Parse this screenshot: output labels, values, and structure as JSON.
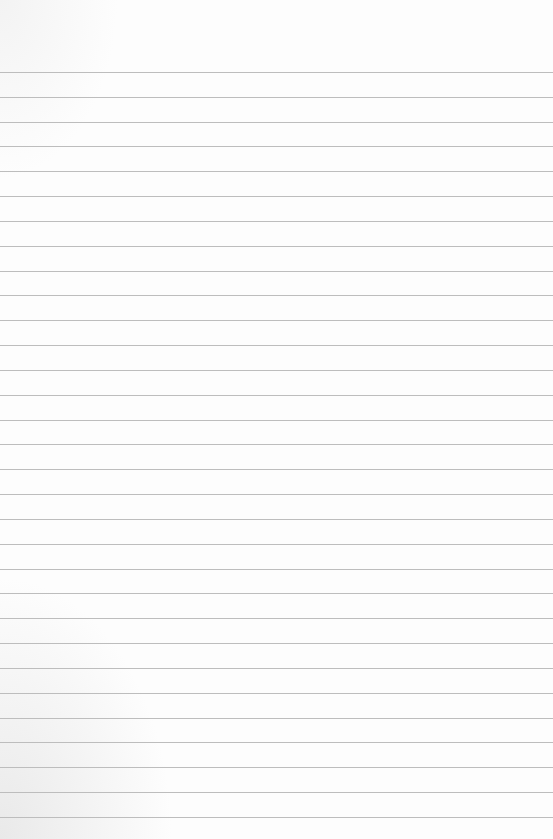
{
  "paper": {
    "type": "lined-paper",
    "background_color": "#fdfdfd",
    "line_color": "#bdbdbd",
    "first_line_y": 72,
    "line_spacing": 24.83,
    "line_count": 31
  }
}
